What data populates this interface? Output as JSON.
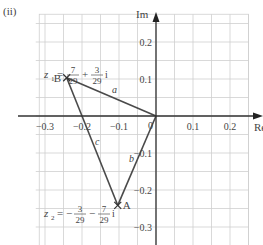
{
  "part_label": "(ii)",
  "axes": {
    "x_label": "Re",
    "y_label": "Im",
    "origin_label": "0",
    "x_ticks": [
      {
        "value": -0.3,
        "label": "−0.3"
      },
      {
        "value": -0.2,
        "label": "−0.2"
      },
      {
        "value": -0.1,
        "label": "−0.1"
      },
      {
        "value": 0.1,
        "label": "0.1"
      },
      {
        "value": 0.2,
        "label": "0.2"
      }
    ],
    "y_ticks": [
      {
        "value": 0.2,
        "label": "0.2"
      },
      {
        "value": 0.1,
        "label": "0.1"
      },
      {
        "value": -0.1,
        "label": "−0.1"
      },
      {
        "value": -0.2,
        "label": "−0.2"
      },
      {
        "value": -0.3,
        "label": "−0.3"
      }
    ],
    "grid_step": 0.05,
    "x_range": [
      -0.3,
      0.25
    ],
    "y_range": [
      -0.35,
      0.25
    ]
  },
  "points": [
    {
      "name": "B",
      "re": -0.2414,
      "im": 0.1034,
      "expr": {
        "var": "z",
        "sub": "1",
        "sign1": "",
        "n1": "7",
        "d1": "29",
        "op": "+",
        "n2": "3",
        "d2": "29",
        "unit": "i"
      }
    },
    {
      "name": "A",
      "re": -0.1034,
      "im": -0.2414,
      "expr": {
        "var": "z",
        "sub": "2",
        "sign1": "−",
        "n1": "3",
        "d1": "29",
        "op": "−",
        "n2": "7",
        "d2": "29",
        "unit": "i"
      }
    }
  ],
  "sides": {
    "a": "a",
    "b": "b",
    "c": "c"
  },
  "colors": {
    "grid": "#c8c8c8",
    "axis": "#333333",
    "line": "#4a4a4a",
    "text": "#444444"
  }
}
